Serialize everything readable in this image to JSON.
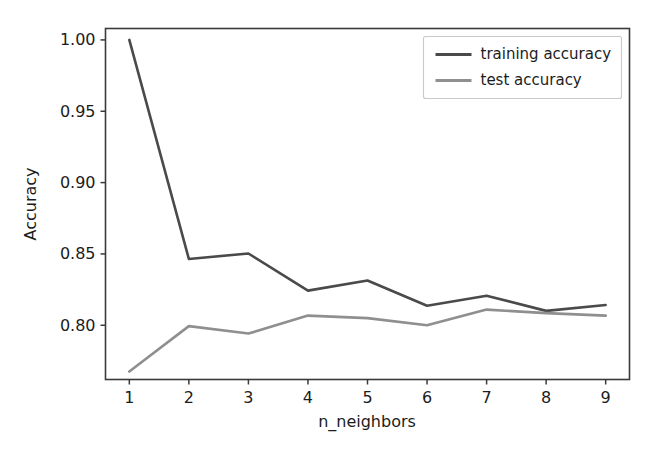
{
  "chart_data": {
    "type": "line",
    "title": "",
    "xlabel": "n_neighbors",
    "ylabel": "Accuracy",
    "x": [
      1,
      2,
      3,
      4,
      5,
      6,
      7,
      8,
      9
    ],
    "xticklabels": [
      "1",
      "2",
      "3",
      "4",
      "5",
      "6",
      "7",
      "8",
      "9"
    ],
    "yticks": [
      0.8,
      0.85,
      0.9,
      0.95,
      1.0
    ],
    "yticklabels": [
      "0.80",
      "0.85",
      "0.90",
      "0.95",
      "1.00"
    ],
    "xlim": [
      0.6,
      9.4
    ],
    "ylim": [
      0.762,
      1.008
    ],
    "grid": false,
    "legend_position": "upper right",
    "series": [
      {
        "name": "training accuracy",
        "color": "#4a4a4a",
        "values": [
          1.0,
          0.8465,
          0.8503,
          0.8243,
          0.8314,
          0.8137,
          0.8207,
          0.8101,
          0.8142
        ]
      },
      {
        "name": "test accuracy",
        "color": "#8f8f8f",
        "values": [
          0.7676,
          0.7994,
          0.7942,
          0.8068,
          0.805,
          0.8,
          0.811,
          0.8085,
          0.8068
        ]
      }
    ]
  },
  "legend": {
    "entries": [
      {
        "label": "training accuracy"
      },
      {
        "label": "test accuracy"
      }
    ]
  },
  "axes": {
    "y_title": "Accuracy",
    "x_title": "n_neighbors"
  }
}
